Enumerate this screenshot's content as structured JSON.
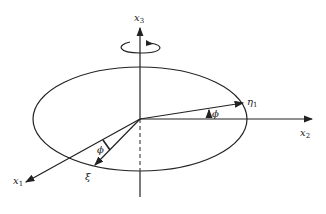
{
  "diagram": {
    "type": "rotating-ellipsoid-coordinate-figure",
    "labels": {
      "x3": {
        "base": "x",
        "sub": "3"
      },
      "x2": {
        "base": "x",
        "sub": "2"
      },
      "x1": {
        "base": "x",
        "sub": "1"
      },
      "eta1": {
        "base": "η",
        "sub": "1"
      },
      "xi": "ξ",
      "phi_upper": "ϕ",
      "phi_lower": "ϕ"
    },
    "colors": {
      "stroke": "#222222",
      "background": "#ffffff"
    }
  }
}
